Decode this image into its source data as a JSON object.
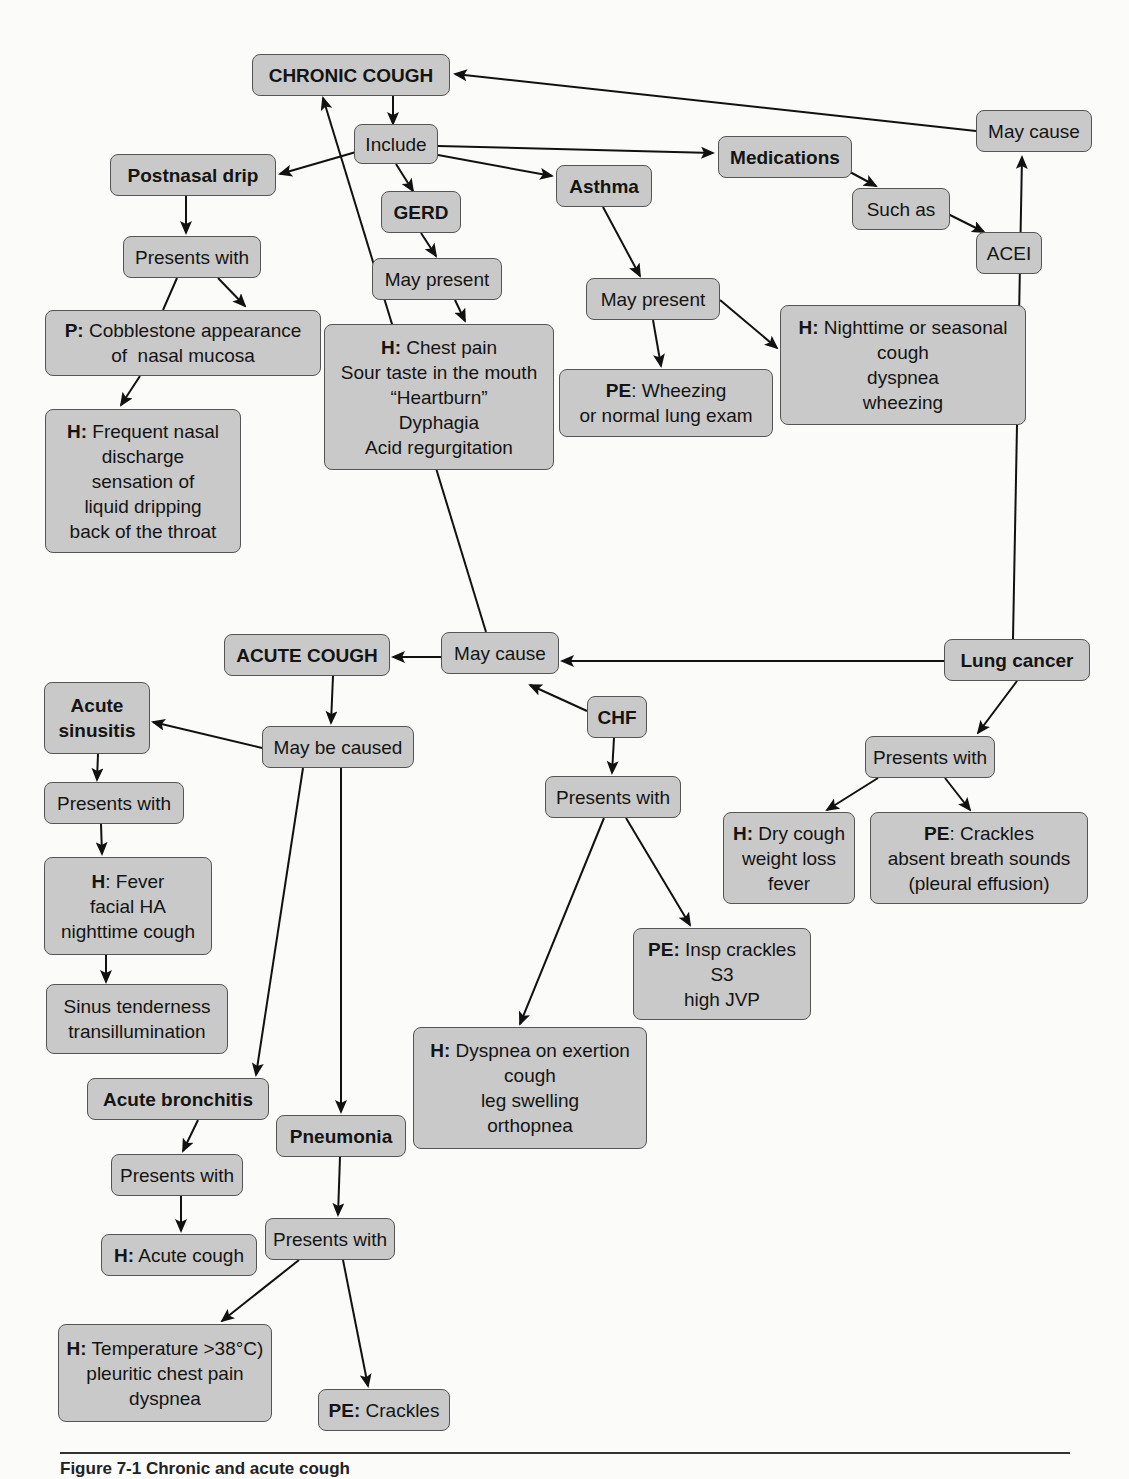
{
  "diagram": {
    "colors": {
      "node_fill": "#c9c9c9",
      "node_border": "#555555",
      "edge": "#111111",
      "background": "#fbfbfa"
    },
    "nodes": [
      {
        "id": "chronic_cough",
        "bold": true,
        "x": 252,
        "y": 54,
        "w": 198,
        "h": 42,
        "lines": [
          {
            "text": "CHRONIC COUGH"
          }
        ]
      },
      {
        "id": "include",
        "x": 354,
        "y": 124,
        "w": 84,
        "h": 40,
        "lines": [
          {
            "text": "Include"
          }
        ]
      },
      {
        "id": "postnasal_drip",
        "bold": true,
        "x": 110,
        "y": 154,
        "w": 166,
        "h": 42,
        "lines": [
          {
            "text": "Postnasal drip"
          }
        ]
      },
      {
        "id": "gerd",
        "bold": true,
        "x": 381,
        "y": 191,
        "w": 80,
        "h": 42,
        "lines": [
          {
            "text": "GERD"
          }
        ]
      },
      {
        "id": "asthma",
        "bold": true,
        "x": 556,
        "y": 165,
        "w": 96,
        "h": 42,
        "lines": [
          {
            "text": "Asthma"
          }
        ]
      },
      {
        "id": "medications",
        "bold": true,
        "x": 718,
        "y": 136,
        "w": 134,
        "h": 42,
        "lines": [
          {
            "text": "Medications"
          }
        ]
      },
      {
        "id": "may_cause_top",
        "x": 976,
        "y": 110,
        "w": 116,
        "h": 42,
        "lines": [
          {
            "text": "May cause"
          }
        ]
      },
      {
        "id": "such_as",
        "x": 852,
        "y": 188,
        "w": 98,
        "h": 42,
        "lines": [
          {
            "text": "Such as"
          }
        ]
      },
      {
        "id": "acei",
        "x": 976,
        "y": 232,
        "w": 66,
        "h": 42,
        "lines": [
          {
            "text": "ACEI"
          }
        ]
      },
      {
        "id": "presents_with_pnd",
        "x": 123,
        "y": 236,
        "w": 138,
        "h": 42,
        "lines": [
          {
            "text": "Presents with"
          }
        ]
      },
      {
        "id": "may_present_gerd",
        "x": 372,
        "y": 258,
        "w": 130,
        "h": 42,
        "lines": [
          {
            "text": "May present"
          }
        ]
      },
      {
        "id": "may_present_asthma",
        "x": 586,
        "y": 278,
        "w": 134,
        "h": 42,
        "lines": [
          {
            "text": "May present"
          }
        ]
      },
      {
        "id": "p_cobblestone",
        "x": 45,
        "y": 310,
        "w": 276,
        "h": 66,
        "lines": [
          {
            "prefix": "P:",
            "text": " Cobblestone appearance"
          },
          {
            "text": "of  nasal mucosa"
          }
        ]
      },
      {
        "id": "h_gerd",
        "x": 324,
        "y": 324,
        "w": 230,
        "h": 146,
        "lines": [
          {
            "prefix": "H:",
            "text": " Chest pain"
          },
          {
            "text": "Sour taste in the mouth"
          },
          {
            "text": "“Heartburn”"
          },
          {
            "text": "Dyphagia"
          },
          {
            "text": "Acid regurgitation"
          }
        ]
      },
      {
        "id": "h_asthma",
        "x": 780,
        "y": 305,
        "w": 246,
        "h": 120,
        "lines": [
          {
            "prefix": "H:",
            "text": " Nighttime or seasonal"
          },
          {
            "text": "cough"
          },
          {
            "text": "dyspnea"
          },
          {
            "text": "wheezing"
          }
        ]
      },
      {
        "id": "pe_asthma",
        "x": 559,
        "y": 369,
        "w": 214,
        "h": 68,
        "lines": [
          {
            "prefix": "PE",
            "text": ": Wheezing"
          },
          {
            "text": "or normal lung exam"
          }
        ]
      },
      {
        "id": "h_pnd",
        "x": 45,
        "y": 409,
        "w": 196,
        "h": 144,
        "lines": [
          {
            "prefix": "H:",
            "text": " Frequent nasal"
          },
          {
            "text": "discharge"
          },
          {
            "text": "sensation of"
          },
          {
            "text": "liquid dripping"
          },
          {
            "text": "back of the throat"
          }
        ]
      },
      {
        "id": "acute_cough",
        "bold": true,
        "x": 224,
        "y": 634,
        "w": 166,
        "h": 42,
        "lines": [
          {
            "text": "ACUTE COUGH"
          }
        ]
      },
      {
        "id": "may_cause_mid",
        "x": 441,
        "y": 632,
        "w": 118,
        "h": 42,
        "lines": [
          {
            "text": "May cause"
          }
        ]
      },
      {
        "id": "lung_cancer",
        "bold": true,
        "x": 944,
        "y": 639,
        "w": 146,
        "h": 42,
        "lines": [
          {
            "text": "Lung cancer"
          }
        ]
      },
      {
        "id": "acute_sinusitis",
        "bold": true,
        "x": 44,
        "y": 682,
        "w": 106,
        "h": 72,
        "lines": [
          {
            "text": "Acute"
          },
          {
            "text": "sinusitis"
          }
        ]
      },
      {
        "id": "chf",
        "bold": true,
        "x": 587,
        "y": 696,
        "w": 60,
        "h": 42,
        "lines": [
          {
            "text": "CHF"
          }
        ]
      },
      {
        "id": "may_be_caused",
        "x": 262,
        "y": 726,
        "w": 152,
        "h": 42,
        "lines": [
          {
            "text": "May be caused"
          }
        ]
      },
      {
        "id": "presents_with_lc",
        "x": 865,
        "y": 736,
        "w": 130,
        "h": 42,
        "lines": [
          {
            "text": "Presents with"
          }
        ]
      },
      {
        "id": "presents_with_chf",
        "x": 545,
        "y": 776,
        "w": 136,
        "h": 42,
        "lines": [
          {
            "text": "Presents with"
          }
        ]
      },
      {
        "id": "presents_with_sin",
        "x": 44,
        "y": 782,
        "w": 140,
        "h": 42,
        "lines": [
          {
            "text": "Presents with"
          }
        ]
      },
      {
        "id": "h_lung_cancer",
        "x": 723,
        "y": 812,
        "w": 132,
        "h": 92,
        "lines": [
          {
            "prefix": "H:",
            "text": " Dry cough"
          },
          {
            "text": "weight loss"
          },
          {
            "text": "fever"
          }
        ]
      },
      {
        "id": "pe_lung_cancer",
        "x": 870,
        "y": 812,
        "w": 218,
        "h": 92,
        "lines": [
          {
            "prefix": "PE",
            "text": ": Crackles"
          },
          {
            "text": "absent breath sounds"
          },
          {
            "text": "(pleural effusion)"
          }
        ]
      },
      {
        "id": "h_sinusitis",
        "x": 44,
        "y": 857,
        "w": 168,
        "h": 98,
        "lines": [
          {
            "prefix": "H",
            "text": ": Fever"
          },
          {
            "text": "facial HA"
          },
          {
            "text": "nighttime cough"
          }
        ]
      },
      {
        "id": "pe_chf",
        "x": 633,
        "y": 928,
        "w": 178,
        "h": 92,
        "lines": [
          {
            "prefix": "PE:",
            "text": " Insp crackles"
          },
          {
            "text": "S3"
          },
          {
            "text": "high JVP"
          }
        ]
      },
      {
        "id": "sinus_tenderness",
        "x": 46,
        "y": 984,
        "w": 182,
        "h": 70,
        "lines": [
          {
            "text": "Sinus tenderness"
          },
          {
            "text": "transillumination"
          }
        ]
      },
      {
        "id": "h_chf",
        "x": 413,
        "y": 1027,
        "w": 234,
        "h": 122,
        "lines": [
          {
            "prefix": "H:",
            "text": " Dyspnea on exertion"
          },
          {
            "text": "cough"
          },
          {
            "text": "leg swelling"
          },
          {
            "text": "orthopnea"
          }
        ]
      },
      {
        "id": "acute_bronchitis",
        "bold": true,
        "x": 87,
        "y": 1078,
        "w": 182,
        "h": 42,
        "lines": [
          {
            "text": "Acute bronchitis"
          }
        ]
      },
      {
        "id": "pneumonia",
        "bold": true,
        "x": 276,
        "y": 1115,
        "w": 130,
        "h": 42,
        "lines": [
          {
            "text": "Pneumonia"
          }
        ]
      },
      {
        "id": "presents_with_ab",
        "x": 111,
        "y": 1154,
        "w": 132,
        "h": 42,
        "lines": [
          {
            "text": "Presents with"
          }
        ]
      },
      {
        "id": "presents_with_pn",
        "x": 265,
        "y": 1218,
        "w": 130,
        "h": 42,
        "lines": [
          {
            "text": "Presents with"
          }
        ]
      },
      {
        "id": "h_acute_cough",
        "x": 101,
        "y": 1234,
        "w": 156,
        "h": 42,
        "lines": [
          {
            "prefix": "H:",
            "text": " Acute cough"
          }
        ]
      },
      {
        "id": "h_pneumonia",
        "x": 58,
        "y": 1324,
        "w": 214,
        "h": 98,
        "lines": [
          {
            "prefix": "H:",
            "text": " Temperature >38°C)"
          },
          {
            "text": "pleuritic chest pain"
          },
          {
            "text": "dyspnea"
          }
        ]
      },
      {
        "id": "pe_pneumonia",
        "x": 318,
        "y": 1389,
        "w": 132,
        "h": 42,
        "lines": [
          {
            "prefix": "PE:",
            "text": " Crackles"
          }
        ]
      }
    ],
    "edges": [
      {
        "from": "chronic_cough",
        "to": "include",
        "points": [
          [
            393,
            96
          ],
          [
            393,
            124
          ]
        ]
      },
      {
        "from": "include",
        "to": "postnasal_drip",
        "points": [
          [
            356,
            152
          ],
          [
            280,
            174
          ]
        ]
      },
      {
        "from": "include",
        "to": "gerd",
        "points": [
          [
            396,
            164
          ],
          [
            413,
            191
          ]
        ]
      },
      {
        "from": "include",
        "to": "asthma",
        "points": [
          [
            438,
            155
          ],
          [
            552,
            176
          ]
        ]
      },
      {
        "from": "include",
        "to": "medications",
        "points": [
          [
            438,
            146
          ],
          [
            713,
            153
          ]
        ]
      },
      {
        "from": "medications",
        "to": "such_as",
        "points": [
          [
            850,
            172
          ],
          [
            876,
            186
          ]
        ]
      },
      {
        "from": "such_as",
        "to": "acei",
        "points": [
          [
            948,
            214
          ],
          [
            984,
            232
          ]
        ]
      },
      {
        "from": "may_cause_top",
        "to": "chronic_cough",
        "points": [
          [
            976,
            131
          ],
          [
            455,
            74
          ]
        ]
      },
      {
        "from": "lung_cancer",
        "to": "may_cause_top",
        "points": [
          [
            1013,
            639
          ],
          [
            1022,
            157
          ]
        ]
      },
      {
        "from": "postnasal_drip",
        "to": "presents_with_pnd",
        "points": [
          [
            186,
            196
          ],
          [
            186,
            233
          ]
        ]
      },
      {
        "from": "presents_with_pnd",
        "to": "p_cobblestone",
        "points": [
          [
            218,
            278
          ],
          [
            245,
            306
          ]
        ]
      },
      {
        "from": "presents_with_pnd",
        "to": "p_cobblestone_line",
        "points": [
          [
            177,
            278
          ],
          [
            163,
            310
          ]
        ],
        "arrow": false
      },
      {
        "from": "p_cobblestone",
        "to": "h_pnd",
        "points": [
          [
            140,
            376
          ],
          [
            121,
            405
          ]
        ]
      },
      {
        "from": "gerd",
        "to": "may_present_gerd",
        "points": [
          [
            421,
            233
          ],
          [
            436,
            256
          ]
        ]
      },
      {
        "from": "may_present_gerd",
        "to": "h_gerd",
        "points": [
          [
            455,
            300
          ],
          [
            465,
            321
          ]
        ]
      },
      {
        "from": "asthma",
        "to": "may_present_asthma",
        "points": [
          [
            603,
            207
          ],
          [
            640,
            276
          ]
        ]
      },
      {
        "from": "may_present_asthma",
        "to": "pe_asthma",
        "points": [
          [
            653,
            320
          ],
          [
            661,
            366
          ]
        ]
      },
      {
        "from": "may_present_asthma",
        "to": "h_asthma",
        "points": [
          [
            720,
            300
          ],
          [
            777,
            348
          ]
        ]
      },
      {
        "from": "may_cause_mid",
        "to": "chronic_cough",
        "points": [
          [
            486,
            632
          ],
          [
            323,
            98
          ]
        ]
      },
      {
        "from": "may_cause_mid",
        "to": "acute_cough",
        "points": [
          [
            441,
            657
          ],
          [
            393,
            657
          ]
        ]
      },
      {
        "from": "lung_cancer",
        "to": "may_cause_mid",
        "points": [
          [
            944,
            661
          ],
          [
            562,
            661
          ]
        ]
      },
      {
        "from": "chf",
        "to": "may_cause_mid",
        "points": [
          [
            587,
            711
          ],
          [
            530,
            685
          ]
        ]
      },
      {
        "from": "acute_cough",
        "to": "may_be_caused",
        "points": [
          [
            333,
            676
          ],
          [
            331,
            723
          ]
        ]
      },
      {
        "from": "may_be_caused",
        "to": "acute_sinusitis",
        "points": [
          [
            262,
            748
          ],
          [
            153,
            722
          ]
        ]
      },
      {
        "from": "may_be_caused",
        "to": "acute_bronchitis",
        "points": [
          [
            303,
            768
          ],
          [
            256,
            1075
          ]
        ]
      },
      {
        "from": "may_be_caused",
        "to": "pneumonia",
        "points": [
          [
            341,
            768
          ],
          [
            341,
            1112
          ]
        ]
      },
      {
        "from": "acute_sinusitis",
        "to": "presents_with_sin",
        "points": [
          [
            98,
            754
          ],
          [
            97,
            780
          ]
        ]
      },
      {
        "from": "presents_with_sin",
        "to": "h_sinusitis",
        "points": [
          [
            101,
            824
          ],
          [
            102,
            854
          ]
        ]
      },
      {
        "from": "h_sinusitis",
        "to": "sinus_tenderness",
        "points": [
          [
            106,
            955
          ],
          [
            106,
            982
          ]
        ]
      },
      {
        "from": "chf",
        "to": "presents_with_chf",
        "points": [
          [
            614,
            738
          ],
          [
            612,
            773
          ]
        ]
      },
      {
        "from": "presents_with_chf",
        "to": "h_chf",
        "points": [
          [
            604,
            818
          ],
          [
            520,
            1024
          ]
        ]
      },
      {
        "from": "presents_with_chf",
        "to": "pe_chf",
        "points": [
          [
            626,
            818
          ],
          [
            690,
            925
          ]
        ]
      },
      {
        "from": "lung_cancer",
        "to": "presents_with_lc",
        "points": [
          [
            1017,
            681
          ],
          [
            978,
            733
          ]
        ]
      },
      {
        "from": "presents_with_lc",
        "to": "h_lung_cancer",
        "points": [
          [
            878,
            778
          ],
          [
            827,
            810
          ]
        ]
      },
      {
        "from": "presents_with_lc",
        "to": "pe_lung_cancer",
        "points": [
          [
            945,
            778
          ],
          [
            970,
            810
          ]
        ]
      },
      {
        "from": "acute_bronchitis",
        "to": "presents_with_ab",
        "points": [
          [
            198,
            1120
          ],
          [
            183,
            1151
          ]
        ]
      },
      {
        "from": "presents_with_ab",
        "to": "h_acute_cough",
        "points": [
          [
            181,
            1196
          ],
          [
            181,
            1231
          ]
        ]
      },
      {
        "from": "pneumonia",
        "to": "presents_with_pn",
        "points": [
          [
            340,
            1157
          ],
          [
            338,
            1215
          ]
        ]
      },
      {
        "from": "presents_with_pn",
        "to": "h_pneumonia",
        "points": [
          [
            299,
            1260
          ],
          [
            222,
            1321
          ]
        ]
      },
      {
        "from": "presents_with_pn",
        "to": "pe_pneumonia",
        "points": [
          [
            343,
            1260
          ],
          [
            368,
            1386
          ]
        ]
      }
    ]
  },
  "caption": {
    "text": "Figure 7-1  Chronic and acute cough"
  }
}
